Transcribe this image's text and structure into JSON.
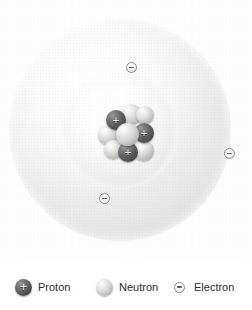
{
  "diagram": {
    "type": "bohr-atom-model",
    "title": "",
    "shells": [
      {
        "name": "inner-electron-shell",
        "radius_px": 59,
        "electron_count": 2
      },
      {
        "name": "outer-electron-shell",
        "radius_px": 111,
        "electron_count": 1
      }
    ],
    "nucleus": {
      "name": "nucleus",
      "proton_count": 3,
      "neutron_count": 6,
      "protons": [
        {
          "label": "+",
          "x": 10,
          "y": 6,
          "size": 20
        },
        {
          "label": "+",
          "x": 38,
          "y": 19,
          "size": 20
        },
        {
          "label": "+",
          "x": 22,
          "y": 38,
          "size": 20
        }
      ],
      "neutrons": [
        {
          "x": 25,
          "y": 0,
          "size": 21
        },
        {
          "x": 2,
          "y": 21,
          "size": 20
        },
        {
          "x": 40,
          "y": 2,
          "size": 18
        },
        {
          "x": 8,
          "y": 36,
          "size": 19
        },
        {
          "x": 37,
          "y": 36,
          "size": 21
        },
        {
          "x": 20,
          "y": 19,
          "size": 23
        }
      ]
    },
    "electrons": [
      {
        "name": "electron-inner-top",
        "label": "-",
        "x": 126,
        "y": 62,
        "shell": "inner"
      },
      {
        "name": "electron-inner-bottom",
        "label": "-",
        "x": 99,
        "y": 193,
        "shell": "inner"
      },
      {
        "name": "electron-outer-right",
        "label": "-",
        "x": 224,
        "y": 148,
        "shell": "outer"
      }
    ],
    "colors": {
      "background": "#ffffff",
      "proton": "#4d4d4d",
      "neutron": "#c8c8c8",
      "electron_fill": "#f4f4f4",
      "electron_stroke": "#8c8c8c",
      "shell_light": "#ffffff",
      "shell_dark": "#dcdcdc",
      "label_text": "#2b2b2b"
    }
  },
  "legend": {
    "name": "legend",
    "items": [
      {
        "icon": "proton-sphere-icon",
        "label": "Proton",
        "symbol": "+"
      },
      {
        "icon": "neutron-sphere-icon",
        "label": "Neutron",
        "symbol": ""
      },
      {
        "icon": "electron-circle-icon",
        "label": "Electron",
        "symbol": "-"
      }
    ]
  }
}
